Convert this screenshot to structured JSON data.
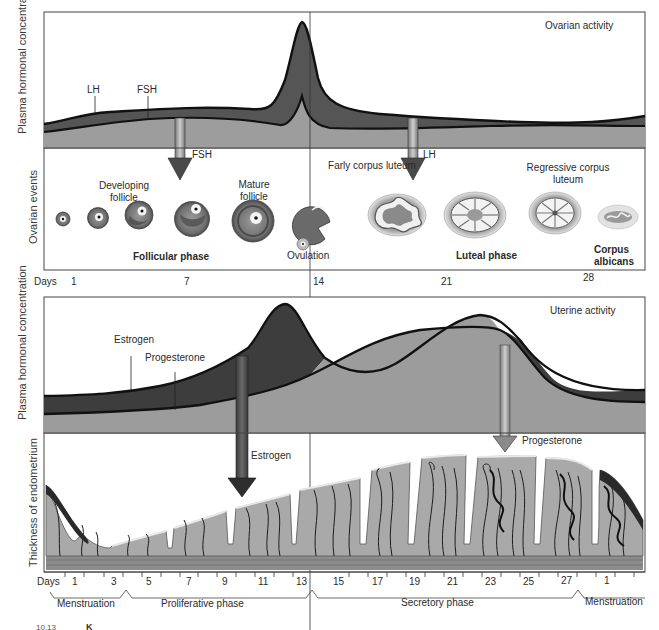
{
  "diagram": {
    "ovarian": {
      "panel_title": "Ovarian activity",
      "y_axis_label_top": "Plasma hormonal concentration",
      "y_axis_label_bottom": "Ovarian events",
      "hormone_labels": {
        "lh": "LH",
        "fsh": "FSH"
      },
      "arrows": [
        {
          "label": "FSH",
          "target": "developing follicle"
        },
        {
          "label": "LH",
          "target": "early corpus luteum"
        }
      ],
      "events": [
        {
          "label": "Developing follicle"
        },
        {
          "label": "Mature follicle"
        },
        {
          "label": "Ovulation"
        },
        {
          "label": "Farly corpus luteum"
        },
        {
          "label": "Regressive corpus luteum"
        },
        {
          "label": "Corpus albicans"
        }
      ],
      "phases": {
        "follicular": "Follicular phase",
        "luteal": "Luteal phase"
      },
      "days_label": "Days",
      "days": [
        "1",
        "7",
        "14",
        "21",
        "28"
      ]
    },
    "uterine": {
      "panel_title": "Uterine activity",
      "y_axis_label_top": "Plasma hormonal concentration",
      "y_axis_label_bottom": "Thickness of endometrium",
      "hormone_labels": {
        "estrogen": "Estrogen",
        "progesterone": "Progesterone"
      },
      "arrows": [
        {
          "label": "Estrogen"
        },
        {
          "label": "Progesterone"
        }
      ],
      "days_label": "Days",
      "days": [
        "1",
        "3",
        "5",
        "7",
        "9",
        "11",
        "13",
        "15",
        "17",
        "19",
        "21",
        "23",
        "25",
        "27",
        "1"
      ],
      "phases": [
        {
          "label": "Menstruation"
        },
        {
          "label": "Proliferative phase"
        },
        {
          "label": "Secretory phase"
        },
        {
          "label": "Menstruation"
        }
      ]
    },
    "footer_fragment": {
      "left": "10.13",
      "right": "K"
    },
    "colors": {
      "dark_hormone": "#3c3c3c",
      "mid_hormone": "#5a5a5a",
      "light_fill": "#9c9c9c",
      "endometrium": "#a8a8a8",
      "frame": "#333333"
    }
  }
}
